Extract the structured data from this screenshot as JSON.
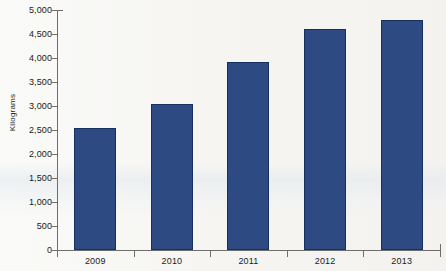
{
  "chart_data": {
    "type": "bar",
    "title": "",
    "xlabel": "",
    "ylabel": "Kilograms",
    "categories": [
      "2009",
      "2010",
      "2011",
      "2012",
      "2013"
    ],
    "values": [
      2540,
      3040,
      3920,
      4600,
      4790
    ],
    "ylim": [
      0,
      5000
    ],
    "ytick_values": [
      0,
      500,
      1000,
      1500,
      2000,
      2500,
      3000,
      3500,
      4000,
      4500,
      5000
    ],
    "ytick_labels": [
      "0",
      "500",
      "1,000",
      "1,500",
      "2,000",
      "2,500",
      "3,000",
      "3,500",
      "4,000",
      "4,500",
      "5,000"
    ],
    "grid": false,
    "legend": null,
    "series": [
      {
        "name": "Kilograms",
        "color": "#2e4a82",
        "values": [
          2540,
          3040,
          3920,
          4600,
          4790
        ]
      }
    ]
  },
  "colors": {
    "bar_fill": "#2e4a82",
    "bar_edge": "#16305f",
    "axis": "#6e6e6e",
    "text": "#1b1b1b",
    "background": "#f4f3f0"
  }
}
